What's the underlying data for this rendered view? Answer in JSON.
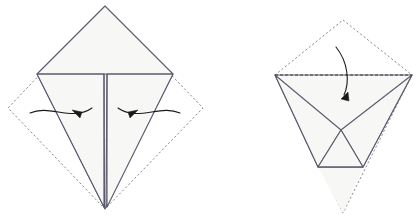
{
  "figure": {
    "background_color": "#ffffff",
    "stroke_color": "#5a5a6e",
    "dashed_color": "#8a8a9a",
    "fill_color": "#f7f7f5",
    "arrow_color": "#1a1a1a",
    "width": 420,
    "height": 221
  },
  "steps": [
    {
      "name": "step-left",
      "label": "Left diagram: kite fold with two inward valley folds",
      "shapes": {
        "dashed_square": {
          "label": "original square outline",
          "points": "105,6 203,108 105,209 8,108"
        },
        "kite_outline": {
          "label": "kite silhouette",
          "points": "105,6 173,74 105,209 37,74"
        },
        "left_flap": {
          "label": "left triangular flap",
          "points": "37,74 104,74 104,207"
        },
        "right_flap": {
          "label": "right triangular flap",
          "points": "107,74 173,74 107,207"
        },
        "center_line_left": {
          "label": "center crease left edge",
          "x1": 104,
          "y1": 74,
          "x2": 104.5,
          "y2": 208
        },
        "center_line_right": {
          "label": "center crease right edge",
          "x1": 107,
          "y1": 74,
          "x2": 106,
          "y2": 208
        },
        "horizontal_crease": {
          "label": "horizontal crease",
          "x1": 37,
          "y1": 74,
          "x2": 173,
          "y2": 74
        }
      },
      "arrows": [
        {
          "name": "arrow-left-inward",
          "label": "fold left flap inward",
          "path": "M 30,113 C 50,104 72,122 92,108",
          "head": "82,112 72,110 80,118",
          "direction": "right"
        },
        {
          "name": "arrow-right-inward",
          "label": "fold right flap inward",
          "path": "M 180,113 C 160,104 138,122 118,108",
          "head": "128,112 138,110 130,118",
          "direction": "left"
        }
      ]
    },
    {
      "name": "step-right",
      "label": "Right diagram: result with top flap folded down",
      "shapes": {
        "dashed_diamond": {
          "label": "ghost outline of previous state",
          "points": "343,20 412,75 343,213 275,75"
        },
        "top_edge_dashed": {
          "label": "folded top edge",
          "x1": 275,
          "y1": 75,
          "x2": 412,
          "y2": 75
        },
        "left_panel": {
          "label": "left folded panel",
          "points": "275,75 341,130 318,167"
        },
        "right_panel": {
          "label": "right folded panel",
          "points": "412,75 341,130 363,167"
        },
        "body": {
          "label": "main body triangle",
          "points": "275,75 412,75 363,167 318,167"
        },
        "center_triangle": {
          "label": "central small triangle",
          "points": "341,130 363,167 318,167"
        },
        "bottom_edge": {
          "label": "bottom solid edge",
          "x1": 318,
          "y1": 167,
          "x2": 363,
          "y2": 167
        },
        "bottom_ghost": {
          "label": "ghost bottom point",
          "points": "318,167 363,167 343,213"
        }
      },
      "arrows": [
        {
          "name": "arrow-fold-down",
          "label": "fold top point down",
          "path": "M 336,47 C 348,62 350,82 344,95",
          "head": "341,99 348,92 349,101",
          "direction": "down"
        }
      ]
    }
  ]
}
